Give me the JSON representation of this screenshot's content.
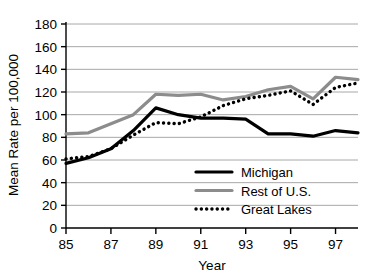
{
  "chart_data": {
    "type": "line",
    "title": "",
    "xlabel": "Year",
    "ylabel": "Mean Rate per 100,000",
    "x": [
      85,
      86,
      87,
      88,
      89,
      90,
      91,
      92,
      93,
      94,
      95,
      96,
      97,
      98
    ],
    "xlim": [
      85,
      98
    ],
    "ylim": [
      0,
      180
    ],
    "ytick_labels": [
      "180",
      "160",
      "140",
      "120",
      "100",
      "80",
      "60",
      "40",
      "20",
      "0"
    ],
    "yticks": [
      180,
      160,
      140,
      120,
      100,
      80,
      60,
      40,
      20,
      0
    ],
    "xtick_labels": [
      "85",
      "87",
      "89",
      "91",
      "93",
      "95",
      "97"
    ],
    "xticks": [
      85,
      87,
      89,
      91,
      93,
      95,
      97
    ],
    "grid": "horizontal",
    "legend_position": "lower-right",
    "series": [
      {
        "name": "Michigan",
        "style": "solid",
        "color": "#000000",
        "width": 3.2,
        "values": [
          57,
          62,
          70,
          86,
          106,
          100,
          97,
          97,
          96,
          83,
          83,
          81,
          86,
          84
        ]
      },
      {
        "name": "Rest of U.S.",
        "style": "solid",
        "color": "#8c8c8c",
        "width": 3.2,
        "values": [
          83,
          84,
          92,
          100,
          118,
          117,
          118,
          113,
          116,
          122,
          125,
          114,
          133,
          131
        ]
      },
      {
        "name": "Great Lakes",
        "style": "dotted",
        "color": "#000000",
        "width": 3.4,
        "values": [
          61,
          63,
          70,
          82,
          93,
          92,
          98,
          108,
          114,
          117,
          121,
          109,
          124,
          128
        ]
      }
    ]
  },
  "legend": {
    "items": [
      {
        "label": "Michigan"
      },
      {
        "label": "Rest of U.S."
      },
      {
        "label": "Great Lakes"
      }
    ]
  },
  "colors": {
    "michigan": "#000000",
    "rest_of_us": "#8c8c8c",
    "great_lakes": "#000000",
    "grid": "#a8a8a8",
    "axis": "#000000",
    "background": "#ffffff"
  }
}
